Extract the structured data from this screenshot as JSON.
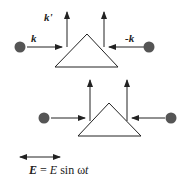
{
  "diagram": {
    "top": {
      "labels": {
        "k_prime": "k'",
        "k": "k",
        "minus_k": "-k"
      }
    },
    "bottom": {},
    "equation": {
      "lhs": "E",
      "equals": "=",
      "rhs_amp": "E",
      "rhs_func": "sin",
      "rhs_omega": "ω",
      "rhs_t": "t"
    },
    "colors": {
      "dot": "#555555",
      "line": "#222222",
      "background": "#ffffff"
    }
  }
}
